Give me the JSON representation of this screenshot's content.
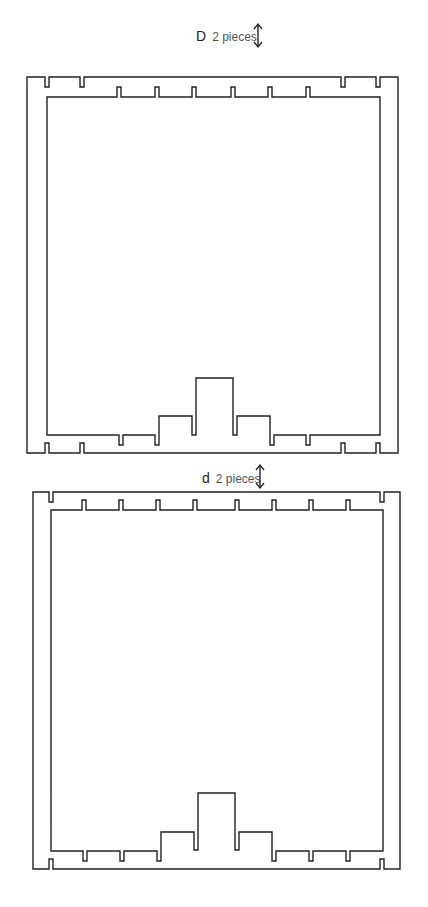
{
  "pieces": [
    {
      "id": "D",
      "letter": "D",
      "quantity_text": "2 pieces",
      "icon": "vertical-double-arrow-icon"
    },
    {
      "id": "d",
      "letter": "d",
      "quantity_text": "2 pieces",
      "icon": "vertical-double-arrow-icon"
    }
  ],
  "colors": {
    "line": "#222222",
    "background": "#ffffff",
    "label": "#555555"
  }
}
